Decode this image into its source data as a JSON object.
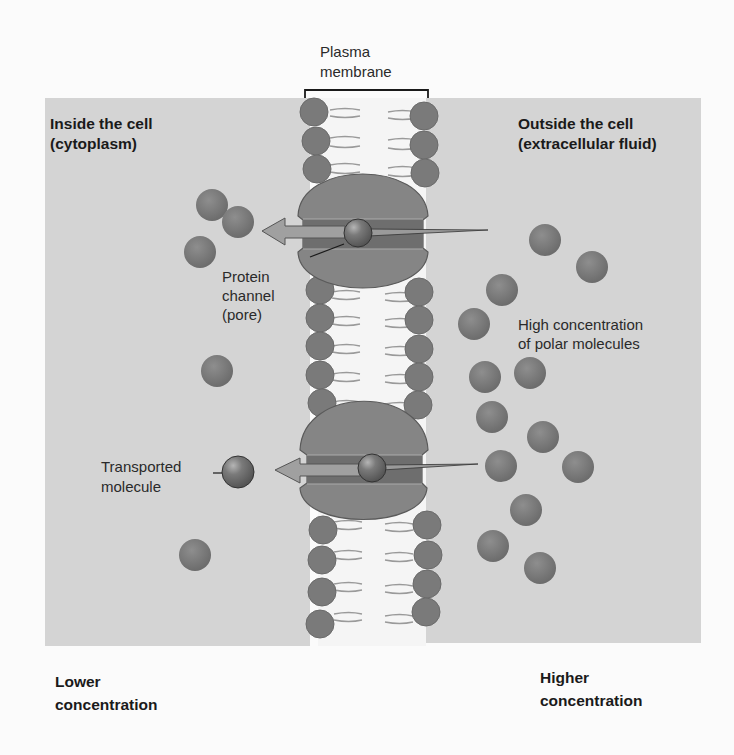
{
  "labels": {
    "plasma_membrane": [
      "Plasma",
      "membrane"
    ],
    "inside_cell": [
      "Inside the cell",
      "(cytoplasm)"
    ],
    "outside_cell": [
      "Outside the cell",
      "(extracellular fluid)"
    ],
    "protein_channel": [
      "Protein",
      "channel",
      "(pore)"
    ],
    "high_concentration": [
      "High concentration",
      "of polar molecules"
    ],
    "transported_molecule": [
      "Transported",
      "molecule"
    ],
    "lower_concentration": [
      "Lower",
      "concentration"
    ],
    "higher_concentration": [
      "Higher",
      "concentration"
    ]
  },
  "colors": {
    "background": "#fbfbfb",
    "fluid": "#d4d4d4",
    "membrane_interior": "#f4f4f4",
    "phospholipid_head": "#7a7a7a",
    "protein": "#858585",
    "molecule": "#7c7c7c",
    "arrow": "#9a9a9a"
  },
  "molecules": {
    "inside": [
      [
        212,
        205
      ],
      [
        238,
        222
      ],
      [
        200,
        252
      ],
      [
        217,
        371
      ],
      [
        195,
        555
      ]
    ],
    "outside": [
      [
        545,
        240
      ],
      [
        592,
        267
      ],
      [
        502,
        290
      ],
      [
        474,
        324
      ],
      [
        530,
        373
      ],
      [
        485,
        377
      ],
      [
        492,
        417
      ],
      [
        543,
        437
      ],
      [
        501,
        466
      ],
      [
        578,
        467
      ],
      [
        526,
        510
      ],
      [
        493,
        546
      ],
      [
        540,
        568
      ]
    ]
  },
  "transported_molecules": [
    [
      238,
      472
    ],
    [
      358,
      233
    ],
    [
      372,
      468
    ]
  ]
}
